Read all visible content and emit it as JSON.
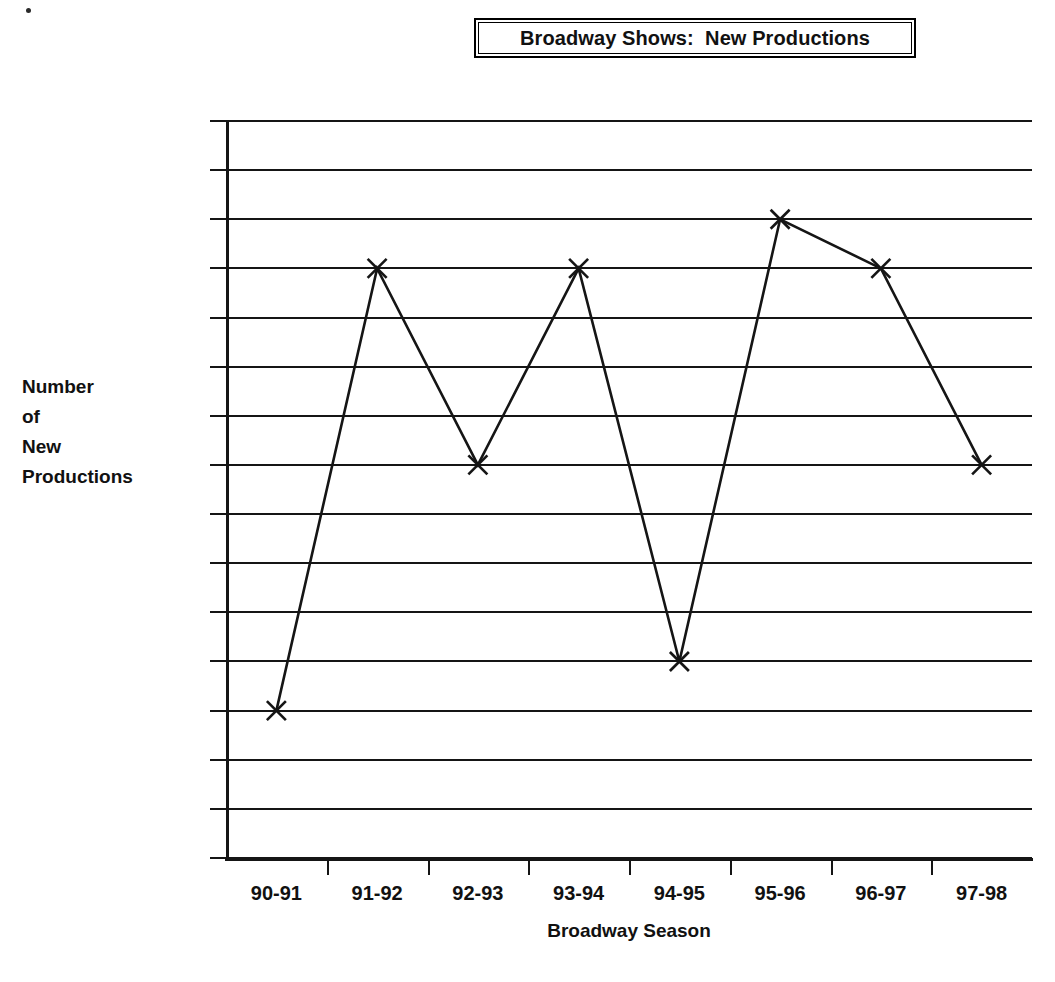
{
  "title": {
    "text": "Broadway Shows:  New Productions"
  },
  "axes": {
    "y_title": "Number\nof\nNew\nProductions",
    "x_title": "Broadway Season"
  },
  "chart_data": {
    "type": "line",
    "title": "Broadway Shows:  New Productions",
    "xlabel": "Broadway Season",
    "ylabel": "Number of New Productions",
    "categories": [
      "90-91",
      "91-92",
      "92-93",
      "93-94",
      "94-95",
      "95-96",
      "96-97",
      "97-98"
    ],
    "values": [
      28,
      37,
      33,
      37,
      29,
      38,
      37,
      33
    ],
    "ylim": [
      25,
      40
    ],
    "ytick_labels": [
      "40",
      "39",
      "38",
      "37",
      "36",
      "35",
      "34",
      "33",
      "32",
      "31",
      "30",
      "29",
      "28",
      "27",
      "26",
      "25"
    ],
    "ytick_values": [
      40,
      39,
      38,
      37,
      36,
      35,
      34,
      33,
      32,
      31,
      30,
      29,
      28,
      27,
      26,
      25
    ],
    "grid": "horizontal",
    "legend": "none",
    "marker": "x-cross",
    "line_color": "#151515",
    "grid_color": "#151515",
    "background": "#ffffff"
  }
}
